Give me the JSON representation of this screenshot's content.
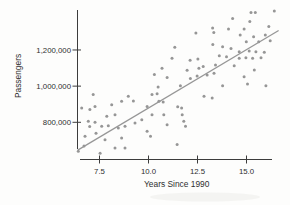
{
  "figure": {
    "background": "#fdfdfc",
    "artifact": "faint-scan-smudge"
  },
  "chart_data": {
    "type": "scatter",
    "title": "",
    "xlabel": "Years Since 1990",
    "ylabel": "Passengers",
    "x_ticks": [
      7.5,
      10.0,
      12.5,
      15.0
    ],
    "x_tick_labels": [
      "7.5",
      "10.0",
      "12.5",
      "15.0"
    ],
    "y_ticks": [
      800000,
      1000000,
      1200000
    ],
    "y_tick_labels": [
      "800,000",
      "1,000,000",
      "1,200,000"
    ],
    "xlim": [
      6.35,
      16.9
    ],
    "ylim": [
      595000,
      1425000
    ],
    "grid": false,
    "legend": null,
    "point_color": "#8d8d8d",
    "axis_color": "#3c3c3c",
    "trend_line": {
      "color": "#979797",
      "x1": 6.39,
      "y1": 646000,
      "x2": 16.64,
      "y2": 1308000
    },
    "points": [
      [
        6.42,
        640000
      ],
      [
        6.59,
        879000
      ],
      [
        6.71,
        669000
      ],
      [
        6.76,
        723000
      ],
      [
        6.93,
        806000
      ],
      [
        7.0,
        776000
      ],
      [
        7.01,
        870000
      ],
      [
        7.18,
        953000
      ],
      [
        7.27,
        800000
      ],
      [
        7.27,
        888000
      ],
      [
        7.32,
        739000
      ],
      [
        7.53,
        629000
      ],
      [
        7.61,
        778000
      ],
      [
        7.78,
        703000
      ],
      [
        7.87,
        833000
      ],
      [
        7.95,
        781000
      ],
      [
        8.12,
        897000
      ],
      [
        8.29,
        842000
      ],
      [
        8.29,
        658000
      ],
      [
        8.46,
        768000
      ],
      [
        8.63,
        916000
      ],
      [
        8.63,
        713000
      ],
      [
        8.8,
        778000
      ],
      [
        8.8,
        658000
      ],
      [
        8.97,
        944000
      ],
      [
        9.23,
        918000
      ],
      [
        9.31,
        796000
      ],
      [
        9.66,
        814000
      ],
      [
        9.93,
        888000
      ],
      [
        9.93,
        750000
      ],
      [
        10.1,
        723000
      ],
      [
        10.18,
        953000
      ],
      [
        10.18,
        842000
      ],
      [
        10.3,
        1064000
      ],
      [
        10.44,
        958000
      ],
      [
        10.49,
        995000
      ],
      [
        10.53,
        916000
      ],
      [
        10.69,
        1099000
      ],
      [
        10.75,
        912000
      ],
      [
        10.78,
        842000
      ],
      [
        10.95,
        1047000
      ],
      [
        10.95,
        787000
      ],
      [
        11.2,
        1154000
      ],
      [
        11.34,
        1215000
      ],
      [
        11.46,
        677000
      ],
      [
        11.49,
        886000
      ],
      [
        11.63,
        1002000
      ],
      [
        11.69,
        879000
      ],
      [
        11.72,
        842000
      ],
      [
        11.8,
        806000
      ],
      [
        11.89,
        778000
      ],
      [
        11.97,
        1088000
      ],
      [
        12.12,
        1143000
      ],
      [
        12.14,
        1043000
      ],
      [
        12.42,
        1294000
      ],
      [
        12.48,
        1056000
      ],
      [
        12.52,
        1150000
      ],
      [
        12.57,
        1099000
      ],
      [
        12.79,
        1108000
      ],
      [
        12.83,
        944000
      ],
      [
        12.99,
        1062000
      ],
      [
        13.25,
        934000
      ],
      [
        13.27,
        1322000
      ],
      [
        13.28,
        1231000
      ],
      [
        13.33,
        1297000
      ],
      [
        13.34,
        1071000
      ],
      [
        13.42,
        1117000
      ],
      [
        13.61,
        1168000
      ],
      [
        13.78,
        1218000
      ],
      [
        13.78,
        1002000
      ],
      [
        13.98,
        1163000
      ],
      [
        14.08,
        1316000
      ],
      [
        14.21,
        1209000
      ],
      [
        14.29,
        1374000
      ],
      [
        14.37,
        1113000
      ],
      [
        14.63,
        1190000
      ],
      [
        14.63,
        1154000
      ],
      [
        14.68,
        1283000
      ],
      [
        14.88,
        1316000
      ],
      [
        14.88,
        1052000
      ],
      [
        14.97,
        1157000
      ],
      [
        14.99,
        1246000
      ],
      [
        15.05,
        1012000
      ],
      [
        15.14,
        1194000
      ],
      [
        15.17,
        1358000
      ],
      [
        15.23,
        1408000
      ],
      [
        15.31,
        1154000
      ],
      [
        15.36,
        1273000
      ],
      [
        15.4,
        1089000
      ],
      [
        15.45,
        1408000
      ],
      [
        15.48,
        1190000
      ],
      [
        15.62,
        1246000
      ],
      [
        15.74,
        1157000
      ],
      [
        15.91,
        1187000
      ],
      [
        15.96,
        1283000
      ],
      [
        15.99,
        1002000
      ],
      [
        16.14,
        1330000
      ],
      [
        16.21,
        1251000
      ],
      [
        16.42,
        1416000
      ]
    ]
  }
}
